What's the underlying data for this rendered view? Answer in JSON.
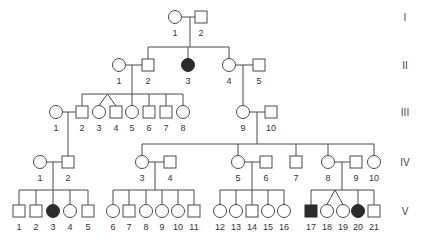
{
  "diagram": {
    "type": "pedigree",
    "colors": {
      "line": "#4a4a4a",
      "unaffected_fill": "#ffffff",
      "affected_fill": "#2b2b2b"
    },
    "generations": [
      {
        "label": "I",
        "y": 17
      },
      {
        "label": "II",
        "y": 65
      },
      {
        "label": "III",
        "y": 112
      },
      {
        "label": "IV",
        "y": 162
      },
      {
        "label": "V",
        "y": 211
      }
    ],
    "individuals": [
      {
        "id": "I-1",
        "gen": "I",
        "num": "1",
        "sex": "female",
        "affected": false,
        "x": 175,
        "y": 17
      },
      {
        "id": "I-2",
        "gen": "I",
        "num": "2",
        "sex": "male",
        "affected": false,
        "x": 201,
        "y": 17
      },
      {
        "id": "II-1",
        "gen": "II",
        "num": "1",
        "sex": "female",
        "affected": false,
        "x": 119,
        "y": 65
      },
      {
        "id": "II-2",
        "gen": "II",
        "num": "2",
        "sex": "male",
        "affected": false,
        "x": 148,
        "y": 65
      },
      {
        "id": "II-3",
        "gen": "II",
        "num": "3",
        "sex": "female",
        "affected": true,
        "x": 188,
        "y": 65
      },
      {
        "id": "II-4",
        "gen": "II",
        "num": "4",
        "sex": "female",
        "affected": false,
        "x": 229,
        "y": 65
      },
      {
        "id": "II-5",
        "gen": "II",
        "num": "5",
        "sex": "male",
        "affected": false,
        "x": 259,
        "y": 65
      },
      {
        "id": "III-1",
        "gen": "III",
        "num": "1",
        "sex": "female",
        "affected": false,
        "x": 56,
        "y": 112
      },
      {
        "id": "III-2",
        "gen": "III",
        "num": "2",
        "sex": "male",
        "affected": false,
        "x": 82,
        "y": 112
      },
      {
        "id": "III-3",
        "gen": "III",
        "num": "3",
        "sex": "female",
        "affected": false,
        "x": 99,
        "y": 112
      },
      {
        "id": "III-4",
        "gen": "III",
        "num": "4",
        "sex": "male",
        "affected": false,
        "x": 116,
        "y": 112
      },
      {
        "id": "III-5",
        "gen": "III",
        "num": "5",
        "sex": "female",
        "affected": false,
        "x": 132,
        "y": 112
      },
      {
        "id": "III-6",
        "gen": "III",
        "num": "6",
        "sex": "male",
        "affected": false,
        "x": 149,
        "y": 112
      },
      {
        "id": "III-7",
        "gen": "III",
        "num": "7",
        "sex": "male",
        "affected": false,
        "x": 166,
        "y": 112
      },
      {
        "id": "III-8",
        "gen": "III",
        "num": "8",
        "sex": "female",
        "affected": false,
        "x": 183,
        "y": 112
      },
      {
        "id": "III-9",
        "gen": "III",
        "num": "9",
        "sex": "female",
        "affected": false,
        "x": 243,
        "y": 112
      },
      {
        "id": "III-10",
        "gen": "III",
        "num": "10",
        "sex": "male",
        "affected": false,
        "x": 271,
        "y": 112
      },
      {
        "id": "IV-1",
        "gen": "IV",
        "num": "1",
        "sex": "female",
        "affected": false,
        "x": 40,
        "y": 162
      },
      {
        "id": "IV-2",
        "gen": "IV",
        "num": "2",
        "sex": "male",
        "affected": false,
        "x": 68,
        "y": 162
      },
      {
        "id": "IV-3",
        "gen": "IV",
        "num": "3",
        "sex": "female",
        "affected": false,
        "x": 142,
        "y": 162
      },
      {
        "id": "IV-4",
        "gen": "IV",
        "num": "4",
        "sex": "male",
        "affected": false,
        "x": 170,
        "y": 162
      },
      {
        "id": "IV-5",
        "gen": "IV",
        "num": "5",
        "sex": "female",
        "affected": false,
        "x": 238,
        "y": 162
      },
      {
        "id": "IV-6",
        "gen": "IV",
        "num": "6",
        "sex": "male",
        "affected": false,
        "x": 266,
        "y": 162
      },
      {
        "id": "IV-7",
        "gen": "IV",
        "num": "7",
        "sex": "male",
        "affected": false,
        "x": 296,
        "y": 162
      },
      {
        "id": "IV-8",
        "gen": "IV",
        "num": "8",
        "sex": "female",
        "affected": false,
        "x": 328,
        "y": 162
      },
      {
        "id": "IV-9",
        "gen": "IV",
        "num": "9",
        "sex": "male",
        "affected": false,
        "x": 356,
        "y": 162
      },
      {
        "id": "IV-10",
        "gen": "IV",
        "num": "10",
        "sex": "female",
        "affected": false,
        "x": 374,
        "y": 162
      },
      {
        "id": "V-1",
        "gen": "V",
        "num": "1",
        "sex": "male",
        "affected": false,
        "x": 19,
        "y": 211
      },
      {
        "id": "V-2",
        "gen": "V",
        "num": "2",
        "sex": "male",
        "affected": false,
        "x": 36,
        "y": 211
      },
      {
        "id": "V-3",
        "gen": "V",
        "num": "3",
        "sex": "female",
        "affected": true,
        "x": 53,
        "y": 211
      },
      {
        "id": "V-4",
        "gen": "V",
        "num": "4",
        "sex": "female",
        "affected": false,
        "x": 70,
        "y": 211
      },
      {
        "id": "V-5",
        "gen": "V",
        "num": "5",
        "sex": "male",
        "affected": false,
        "x": 88,
        "y": 211
      },
      {
        "id": "V-6",
        "gen": "V",
        "num": "6",
        "sex": "female",
        "affected": false,
        "x": 113,
        "y": 211
      },
      {
        "id": "V-7",
        "gen": "V",
        "num": "7",
        "sex": "male",
        "affected": false,
        "x": 129,
        "y": 211
      },
      {
        "id": "V-8",
        "gen": "V",
        "num": "8",
        "sex": "female",
        "affected": false,
        "x": 146,
        "y": 211
      },
      {
        "id": "V-9",
        "gen": "V",
        "num": "9",
        "sex": "female",
        "affected": false,
        "x": 162,
        "y": 211
      },
      {
        "id": "V-10",
        "gen": "V",
        "num": "10",
        "sex": "female",
        "affected": false,
        "x": 178,
        "y": 211
      },
      {
        "id": "V-11",
        "gen": "V",
        "num": "11",
        "sex": "male",
        "affected": false,
        "x": 194,
        "y": 211
      },
      {
        "id": "V-12",
        "gen": "V",
        "num": "12",
        "sex": "female",
        "affected": false,
        "x": 220,
        "y": 211
      },
      {
        "id": "V-13",
        "gen": "V",
        "num": "13",
        "sex": "female",
        "affected": false,
        "x": 236,
        "y": 211
      },
      {
        "id": "V-14",
        "gen": "V",
        "num": "14",
        "sex": "male",
        "affected": false,
        "x": 252,
        "y": 211
      },
      {
        "id": "V-15",
        "gen": "V",
        "num": "15",
        "sex": "female",
        "affected": false,
        "x": 268,
        "y": 211
      },
      {
        "id": "V-16",
        "gen": "V",
        "num": "16",
        "sex": "female",
        "affected": false,
        "x": 284,
        "y": 211
      },
      {
        "id": "V-17",
        "gen": "V",
        "num": "17",
        "sex": "male",
        "affected": true,
        "x": 311,
        "y": 211
      },
      {
        "id": "V-18",
        "gen": "V",
        "num": "18",
        "sex": "female",
        "affected": false,
        "x": 327,
        "y": 211
      },
      {
        "id": "V-19",
        "gen": "V",
        "num": "19",
        "sex": "female",
        "affected": false,
        "x": 343,
        "y": 211
      },
      {
        "id": "V-20",
        "gen": "V",
        "num": "20",
        "sex": "female",
        "affected": true,
        "x": 358,
        "y": 211
      },
      {
        "id": "V-21",
        "gen": "V",
        "num": "21",
        "sex": "male",
        "affected": false,
        "x": 374,
        "y": 211
      }
    ],
    "matings": [
      {
        "partners": [
          "I-1",
          "I-2"
        ],
        "descent_x": 190,
        "sibship_y": 47,
        "children": [
          "II-2",
          "II-3",
          "II-4"
        ]
      },
      {
        "partners": [
          "II-1",
          "II-2"
        ],
        "descent_x": 132,
        "sibship_y": 94,
        "children": [
          "III-2",
          "III-3",
          "III-4",
          "III-5",
          "III-6",
          "III-7",
          "III-8"
        ],
        "twins": [
          [
            "III-3",
            "III-4"
          ]
        ]
      },
      {
        "partners": [
          "II-4",
          "II-5"
        ],
        "descent_x": 243,
        "sibship_y": null,
        "children": [
          "III-9"
        ]
      },
      {
        "partners": [
          "III-1",
          "III-2"
        ],
        "descent_x": 68,
        "sibship_y": null,
        "children": [
          "IV-2"
        ]
      },
      {
        "partners": [
          "III-9",
          "III-10"
        ],
        "descent_x": 257,
        "sibship_y": 144,
        "children": [
          "IV-3",
          "IV-5",
          "IV-7",
          "IV-8",
          "IV-10"
        ]
      },
      {
        "partners": [
          "IV-1",
          "IV-2"
        ],
        "descent_x": 53,
        "sibship_y": 190,
        "children": [
          "V-1",
          "V-2",
          "V-3",
          "V-4",
          "V-5"
        ]
      },
      {
        "partners": [
          "IV-3",
          "IV-4"
        ],
        "descent_x": 155,
        "sibship_y": 190,
        "children": [
          "V-6",
          "V-7",
          "V-8",
          "V-9",
          "V-10",
          "V-11"
        ]
      },
      {
        "partners": [
          "IV-5",
          "IV-6"
        ],
        "descent_x": 252,
        "sibship_y": 190,
        "children": [
          "V-12",
          "V-13",
          "V-14",
          "V-15",
          "V-16"
        ]
      },
      {
        "partners": [
          "IV-8",
          "IV-9"
        ],
        "descent_x": 342,
        "sibship_y": 190,
        "children": [
          "V-17",
          "V-18",
          "V-19",
          "V-20",
          "V-21"
        ],
        "twins": [
          [
            "V-18",
            "V-19"
          ]
        ]
      }
    ],
    "gen_label_x": 405
  }
}
